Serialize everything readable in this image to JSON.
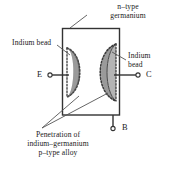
{
  "figure": {
    "labels": {
      "n_type": "n–type\ngermanium",
      "n_type_line1": "n–type",
      "n_type_line2": "germanium",
      "indium_bead_left": "Indium bead",
      "indium_bead_right_line1": "Indium",
      "indium_bead_right_line2": "bead",
      "penetration_line1": "Penetration of",
      "penetration_line2": "indium–germanium",
      "penetration_line3": "p–type alloy"
    },
    "terminals": {
      "emitter": "E",
      "collector": "C",
      "base": "B"
    },
    "colors": {
      "stroke": "#333333",
      "bead_light": "#e2e2e2",
      "bead_dark": "#9a9a9a",
      "leader": "#555555",
      "text": "#1a1a1a",
      "background": "#ffffff"
    }
  }
}
